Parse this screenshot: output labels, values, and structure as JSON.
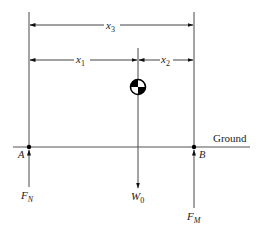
{
  "diagram": {
    "dimensions": {
      "x3": {
        "var": "x",
        "sub": "3"
      },
      "x1": {
        "var": "x",
        "sub": "1"
      },
      "x2": {
        "var": "x",
        "sub": "2"
      }
    },
    "ground_label": "Ground",
    "points": {
      "A": "A",
      "B": "B"
    },
    "forces": {
      "FN": {
        "var": "F",
        "sub": "N"
      },
      "W0": {
        "var": "W",
        "sub": "0"
      },
      "FM": {
        "var": "F",
        "sub": "M"
      }
    },
    "center_of_mass_icon": "center-of-mass-symbol",
    "colors": {
      "line": "#555555",
      "text": "#222222",
      "arrow": "#111111"
    }
  }
}
